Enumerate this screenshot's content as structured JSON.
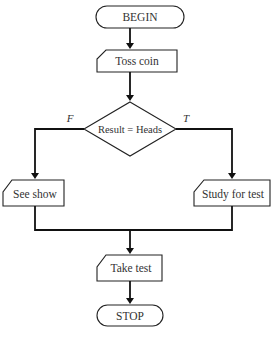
{
  "diagram": {
    "type": "flowchart",
    "nodes": {
      "begin": {
        "label": "BEGIN",
        "shape": "terminator"
      },
      "toss": {
        "label": "Toss coin",
        "shape": "manual-input"
      },
      "decision": {
        "label": "Result = Heads",
        "shape": "decision"
      },
      "see_show": {
        "label": "See show",
        "shape": "manual-input"
      },
      "study": {
        "label": "Study for test",
        "shape": "manual-input"
      },
      "take_test": {
        "label": "Take test",
        "shape": "manual-input"
      },
      "stop": {
        "label": "STOP",
        "shape": "terminator"
      }
    },
    "branch_labels": {
      "false": "F",
      "true": "T"
    },
    "edges": [
      {
        "from": "begin",
        "to": "toss"
      },
      {
        "from": "toss",
        "to": "decision"
      },
      {
        "from": "decision",
        "to": "see_show",
        "label": "F"
      },
      {
        "from": "decision",
        "to": "study",
        "label": "T"
      },
      {
        "from": "see_show",
        "to": "take_test"
      },
      {
        "from": "study",
        "to": "take_test"
      },
      {
        "from": "take_test",
        "to": "stop"
      }
    ],
    "colors": {
      "stroke": "#222222",
      "text": "#333333",
      "background": "#ffffff"
    }
  }
}
